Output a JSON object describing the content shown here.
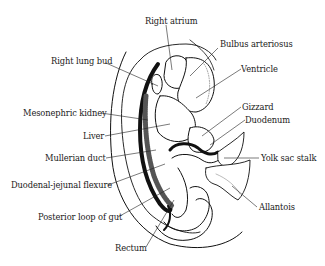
{
  "diagram": {
    "colors": {
      "ink": "#111111",
      "background": "#ffffff"
    },
    "labels": [
      {
        "id": "right-atrium",
        "text": "Right atrium"
      },
      {
        "id": "bulbus-arteriosus",
        "text": "Bulbus arteriosus"
      },
      {
        "id": "right-lung-bud",
        "text": "Right lung bud"
      },
      {
        "id": "ventricle",
        "text": "Ventricle"
      },
      {
        "id": "mesonephric-kidney",
        "text": "Mesonephric kidney"
      },
      {
        "id": "gizzard",
        "text": "Gizzard"
      },
      {
        "id": "duodenum",
        "text": "Duodenum"
      },
      {
        "id": "liver",
        "text": "Liver"
      },
      {
        "id": "mullerian-duct",
        "text": "Mullerian duct"
      },
      {
        "id": "yolk-sac-stalk",
        "text": "Yolk sac stalk"
      },
      {
        "id": "duodenal-jejunal-flexure",
        "text": "Duodenal-jejunal flexure"
      },
      {
        "id": "allantois",
        "text": "Allantois"
      },
      {
        "id": "posterior-loop-of-gut",
        "text": "Posterior loop of gut"
      },
      {
        "id": "rectum",
        "text": "Rectum"
      }
    ]
  }
}
